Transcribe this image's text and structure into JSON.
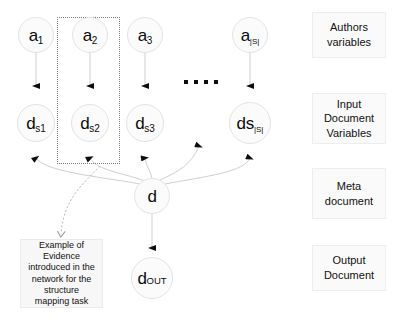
{
  "diagram": {
    "author_nodes": [
      {
        "id": "a1",
        "base": "a",
        "sub": "1"
      },
      {
        "id": "a2",
        "base": "a",
        "sub": "2"
      },
      {
        "id": "a3",
        "base": "a",
        "sub": "3"
      },
      {
        "id": "aS",
        "base": "a",
        "sub": "|S|"
      }
    ],
    "input_doc_nodes": [
      {
        "id": "ds1",
        "base": "d",
        "sub": "s1"
      },
      {
        "id": "ds2",
        "base": "d",
        "sub": "s2"
      },
      {
        "id": "ds3",
        "base": "d",
        "sub": "s3"
      },
      {
        "id": "dsS",
        "base": "ds",
        "sub": "|S|"
      }
    ],
    "meta_node": {
      "id": "d",
      "base": "d",
      "sub": ""
    },
    "output_node": {
      "id": "dout",
      "base": "d",
      "sub": "OUT"
    },
    "ellipsis": "• • • •",
    "evidence_note": "Example of\nEvidence\nintroduced in the\nnetwork for the\nstructure\nmapping task",
    "legend": [
      {
        "id": "authors-variables",
        "label": "Authors\nvariables"
      },
      {
        "id": "input-document-variables",
        "label": "Input\nDocument\nVariables"
      },
      {
        "id": "meta-document",
        "label": "Meta\ndocument"
      },
      {
        "id": "output-document",
        "label": "Output\nDocument"
      }
    ],
    "colors": {
      "node_fill": "#fbfbfb",
      "node_stroke": "#e3e3e3",
      "edge": "#c9c9c9",
      "arrowhead": "#0d0d0d",
      "legend_fill": "#fafafa",
      "legend_stroke": "#ededed",
      "note_fill": "#f7f7f7",
      "dotted_group": "#7a7a7a"
    }
  }
}
